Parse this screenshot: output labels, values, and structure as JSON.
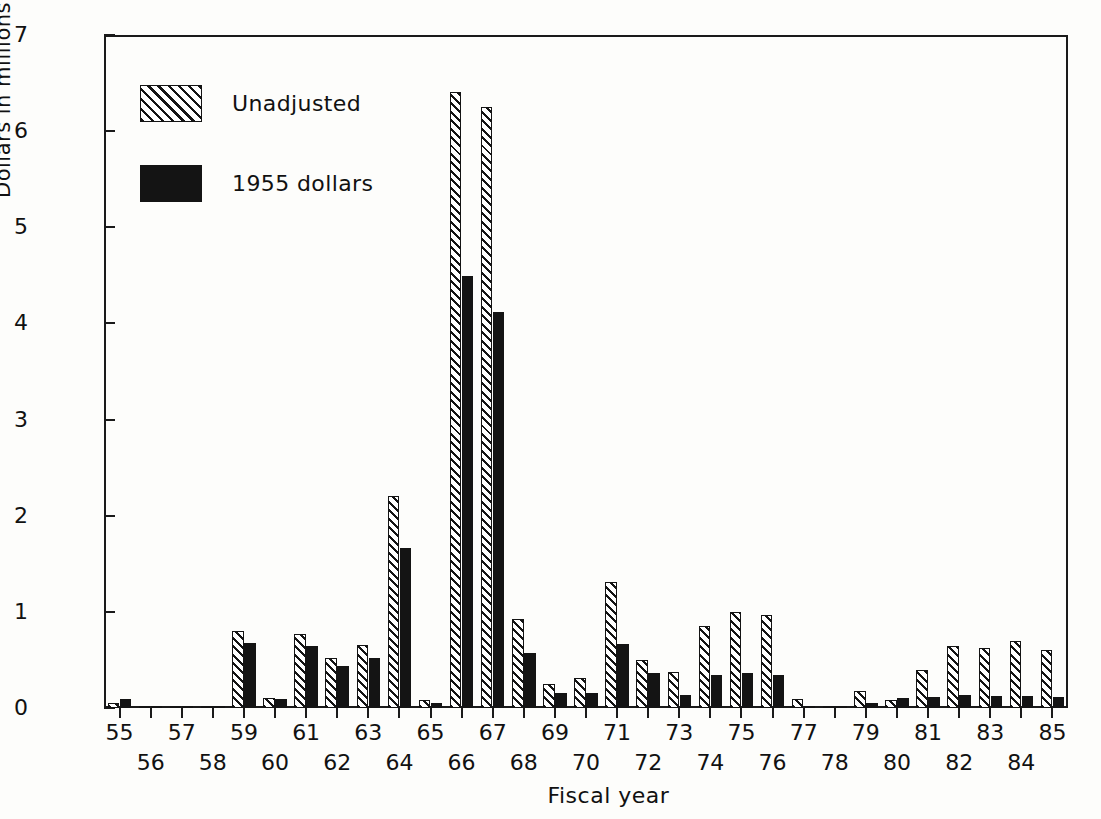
{
  "chart_data": {
    "type": "bar",
    "title": "",
    "xlabel": "Fiscal year",
    "ylabel": "Dollars in millions",
    "ylim": [
      0,
      7
    ],
    "yticks": [
      0,
      1,
      2,
      3,
      4,
      5,
      6,
      7
    ],
    "ytick_labels": [
      "0",
      "1",
      "2",
      "3",
      "4",
      "5",
      "6",
      "7"
    ],
    "grid": false,
    "legend_position": "upper-left-inside",
    "categories": [
      "55",
      "56",
      "57",
      "58",
      "59",
      "60",
      "61",
      "62",
      "63",
      "64",
      "65",
      "66",
      "67",
      "68",
      "69",
      "70",
      "71",
      "72",
      "73",
      "74",
      "75",
      "76",
      "77",
      "78",
      "79",
      "80",
      "81",
      "82",
      "83",
      "84",
      "85"
    ],
    "series": [
      {
        "name": "Unadjusted",
        "style": "diagonal-hatch",
        "color": "#ffffff",
        "edge_color": "#141414",
        "values": [
          0.05,
          0.0,
          0.01,
          0.01,
          0.8,
          0.1,
          0.77,
          0.52,
          0.66,
          2.21,
          0.08,
          6.41,
          6.25,
          0.93,
          0.25,
          0.31,
          1.31,
          0.5,
          0.37,
          0.85,
          1.0,
          0.97,
          0.09,
          0.02,
          0.18,
          0.08,
          0.4,
          0.65,
          0.62,
          0.7,
          0.6
        ]
      },
      {
        "name": "1955 dollars",
        "style": "solid",
        "color": "#141414",
        "edge_color": "#141414",
        "values": [
          0.09,
          0.0,
          0.01,
          0.01,
          0.68,
          0.09,
          0.64,
          0.44,
          0.52,
          1.66,
          0.05,
          4.49,
          4.12,
          0.57,
          0.16,
          0.16,
          0.67,
          0.36,
          0.14,
          0.34,
          0.36,
          0.34,
          0.02,
          0.01,
          0.05,
          0.1,
          0.11,
          0.14,
          0.12,
          0.13,
          0.11
        ]
      }
    ],
    "xtick_labels_top": [
      "55",
      "57",
      "59",
      "61",
      "63",
      "65",
      "67",
      "69",
      "71",
      "73",
      "75",
      "77",
      "79",
      "81",
      "83",
      "85"
    ],
    "xtick_labels_bottom": [
      "56",
      "58",
      "60",
      "62",
      "64",
      "66",
      "68",
      "70",
      "72",
      "74",
      "76",
      "78",
      "80",
      "82",
      "84"
    ],
    "annotations": []
  },
  "legend": {
    "entries": [
      {
        "label": "Unadjusted",
        "swatch": "hatched-swatch"
      },
      {
        "label": "1955 dollars",
        "swatch": "solid-black-swatch"
      }
    ]
  },
  "axes": {
    "y_title": "Dollars in millions",
    "x_title": "Fiscal year"
  },
  "caption": ""
}
